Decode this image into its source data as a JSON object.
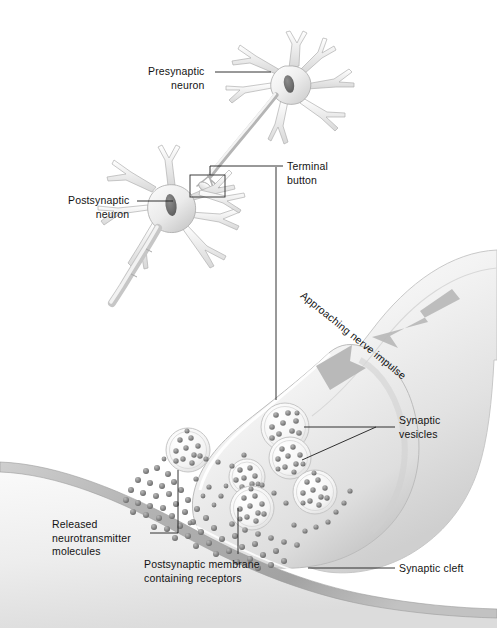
{
  "figure": {
    "background": "#ffffff",
    "ink": "#131313",
    "tissue_light": "#efefef",
    "tissue_mid": "#d6d6d6",
    "tissue_dark": "#9a9a9a",
    "width": 497,
    "height": 628
  },
  "labels": {
    "presynaptic_neuron": "Presynaptic\nneuron",
    "postsynaptic_neuron": "Postsynaptic\nneuron",
    "terminal_button": "Terminal\nbutton",
    "approaching_nerve_impulse": "Approaching nerve impulse",
    "synaptic_vesicles": "Synaptic\nvesicles",
    "synaptic_cleft": "Synaptic cleft",
    "released_neurotransmitter_molecules": "Released\nneurotransmitter\nmolecules",
    "postsynaptic_membrane": "Postsynaptic membrane\ncontaining receptors"
  },
  "structures": {
    "presynaptic_neuron": {
      "soma_center": [
        289,
        85
      ],
      "nucleus_center": [
        288,
        84
      ],
      "dendrite_count": 7
    },
    "postsynaptic_neuron": {
      "soma_center": [
        168,
        205
      ],
      "nucleus_center": [
        170,
        204
      ],
      "dendrite_count": 8,
      "axon_end": [
        118,
        300
      ]
    },
    "terminal_button_callout_box": {
      "x": 190,
      "y": 175,
      "w": 35,
      "h": 22
    },
    "magnified_terminal_button": {
      "bulb_center": [
        258,
        455
      ],
      "axon_entry": [
        470,
        268
      ]
    },
    "impulse_arrow": {
      "from": [
        430,
        300
      ],
      "to": [
        316,
        365
      ],
      "color": "#b4b4b4"
    },
    "synaptic_vesicles": [
      {
        "cx": 188,
        "cy": 450,
        "r": 22,
        "granules": 11
      },
      {
        "cx": 247,
        "cy": 477,
        "r": 18,
        "granules": 9
      },
      {
        "cx": 285,
        "cy": 427,
        "r": 24,
        "granules": 12
      },
      {
        "cx": 290,
        "cy": 458,
        "r": 21,
        "granules": 10
      },
      {
        "cx": 252,
        "cy": 508,
        "r": 22,
        "granules": 11
      },
      {
        "cx": 315,
        "cy": 492,
        "r": 22,
        "granules": 11
      }
    ],
    "postsynaptic_membrane_band": {
      "from": [
        12,
        463
      ],
      "to": [
        330,
        585
      ]
    },
    "released_molecules_count": 78
  },
  "leaders": {
    "presynaptic_neuron": [
      [
        215,
        72
      ],
      [
        270,
        72
      ]
    ],
    "postsynaptic_neuron": [
      [
        137,
        201
      ],
      [
        172,
        201
      ]
    ],
    "terminal_button": [
      [
        210,
        175
      ],
      [
        210,
        166
      ],
      [
        283,
        166
      ]
    ],
    "terminal_button_drop": [
      [
        276,
        166
      ],
      [
        276,
        400
      ]
    ],
    "synaptic_vesicles_main": [
      [
        376,
        427
      ],
      [
        394,
        427
      ]
    ],
    "synaptic_vesicles_branch_a": [
      [
        376,
        427
      ],
      [
        303,
        427
      ]
    ],
    "synaptic_vesicles_branch_b": [
      [
        376,
        427
      ],
      [
        300,
        460
      ]
    ],
    "synaptic_cleft": [
      [
        308,
        568
      ],
      [
        394,
        568
      ]
    ],
    "released_nt": [
      [
        150,
        533
      ],
      [
        178,
        533
      ],
      [
        178,
        470
      ]
    ],
    "postsynaptic_membrane": [
      [
        238,
        553
      ],
      [
        238,
        508
      ]
    ]
  }
}
